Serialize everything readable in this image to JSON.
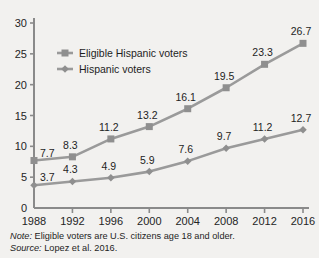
{
  "chart_data": {
    "type": "line",
    "title": "",
    "subtitle": "",
    "xlabel": "",
    "ylabel": "",
    "categories": [
      "1988",
      "1992",
      "1996",
      "2000",
      "2004",
      "2008",
      "2012",
      "2016"
    ],
    "x": [
      1988,
      1992,
      1996,
      2000,
      2004,
      2008,
      2012,
      2016
    ],
    "ylim": [
      0,
      30
    ],
    "yticks": [
      "0",
      "5",
      "10",
      "15",
      "20",
      "25",
      "30"
    ],
    "ytick_values": [
      0,
      5,
      10,
      15,
      20,
      25,
      30
    ],
    "grid": false,
    "legend_position": "upper-left-inside",
    "series": [
      {
        "name": "Eligible Hispanic voters",
        "marker": "square",
        "color": "#8f8f8f",
        "values": [
          7.7,
          8.3,
          11.2,
          13.2,
          16.1,
          19.5,
          23.3,
          26.7
        ],
        "labels": [
          "7.7",
          "8.3",
          "11.2",
          "13.2",
          "16.1",
          "19.5",
          "23.3",
          "26.7"
        ]
      },
      {
        "name": "Hispanic voters",
        "marker": "diamond",
        "color": "#8f8f8f",
        "values": [
          3.7,
          4.3,
          4.9,
          5.9,
          7.6,
          9.7,
          11.2,
          12.7
        ],
        "labels": [
          "3.7",
          "4.3",
          "4.9",
          "5.9",
          "7.6",
          "9.7",
          "11.2",
          "12.7"
        ]
      }
    ],
    "annotations": [
      "Note: Eligible voters are U.S. citizens age 18 and older.",
      "Source: Lopez et al. 2016."
    ]
  },
  "legend": {
    "items": [
      {
        "label": "Eligible Hispanic voters"
      },
      {
        "label": "Hispanic voters"
      }
    ]
  },
  "footnotes": {
    "note_key": "Note:",
    "note_text": " Eligible voters are U.S. citizens age 18 and older.",
    "source_key": "Source:",
    "source_text": " Lopez et al. 2016."
  },
  "colors": {
    "background": "#f2f1ef",
    "axis": "#8a8a8a",
    "series": "#8f8f8f",
    "text": "#1e1e1e"
  }
}
